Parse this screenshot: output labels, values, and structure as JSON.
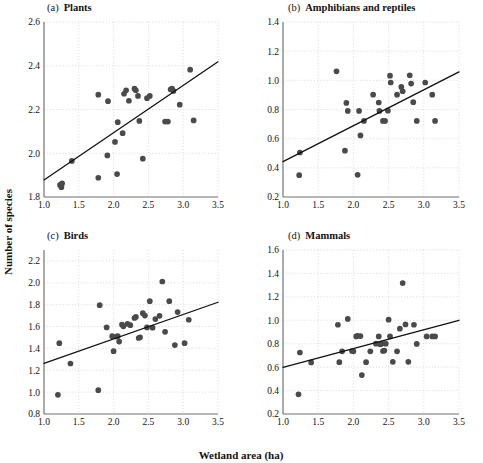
{
  "figure": {
    "xlabel": "Wetland area (ha)",
    "ylabel": "Number of species",
    "point_color": "#4a4a4a",
    "line_color": "#111111",
    "grid_color": "#c9c9c9",
    "axis_color": "#6e6e6e"
  },
  "chart_data": [
    {
      "type": "scatter",
      "panel": "a",
      "label": "(a)",
      "title": "Plants",
      "xlabel": "Wetland area (ha)",
      "ylabel": "Number of species",
      "xlim": [
        1.0,
        3.5
      ],
      "ylim": [
        1.8,
        2.6
      ],
      "xticks": [
        1.0,
        1.5,
        2.0,
        2.5,
        3.0,
        3.5
      ],
      "yticks": [
        1.8,
        2.0,
        2.2,
        2.4,
        2.6
      ],
      "xticklabels": [
        "1.0",
        "1.5",
        "2.0",
        "2.5",
        "3.0",
        "3.5"
      ],
      "yticklabels": [
        "1.8",
        "2.0",
        "2.2",
        "2.4",
        "2.6"
      ],
      "grid": true,
      "points": [
        [
          1.23,
          1.855
        ],
        [
          1.25,
          1.845
        ],
        [
          1.26,
          1.862
        ],
        [
          1.4,
          1.965
        ],
        [
          1.78,
          1.888
        ],
        [
          1.78,
          2.268
        ],
        [
          1.91,
          1.99
        ],
        [
          1.92,
          2.238
        ],
        [
          2.02,
          2.052
        ],
        [
          2.05,
          1.905
        ],
        [
          2.06,
          2.142
        ],
        [
          2.13,
          2.092
        ],
        [
          2.15,
          2.272
        ],
        [
          2.18,
          2.288
        ],
        [
          2.22,
          2.24
        ],
        [
          2.3,
          2.295
        ],
        [
          2.32,
          2.288
        ],
        [
          2.35,
          2.262
        ],
        [
          2.37,
          2.148
        ],
        [
          2.42,
          1.975
        ],
        [
          2.48,
          2.252
        ],
        [
          2.52,
          2.262
        ],
        [
          2.74,
          2.145
        ],
        [
          2.78,
          2.145
        ],
        [
          2.82,
          2.292
        ],
        [
          2.84,
          2.295
        ],
        [
          2.86,
          2.285
        ],
        [
          2.95,
          2.222
        ],
        [
          3.1,
          2.382
        ],
        [
          3.15,
          2.15
        ]
      ],
      "fit_line": {
        "x": [
          1.0,
          3.5
        ],
        "y": [
          1.878,
          2.418
        ],
        "note": "least-squares regression line"
      }
    },
    {
      "type": "scatter",
      "panel": "b",
      "label": "(b)",
      "title": "Amphibians and reptiles",
      "xlabel": "Wetland area (ha)",
      "ylabel": "Number of species",
      "xlim": [
        1.0,
        3.5
      ],
      "ylim": [
        0.2,
        1.4
      ],
      "xticks": [
        1.0,
        1.5,
        2.0,
        2.5,
        3.0,
        3.5
      ],
      "yticks": [
        0.2,
        0.4,
        0.6,
        0.8,
        1.0,
        1.2,
        1.4
      ],
      "xticklabels": [
        "1.0",
        "1.5",
        "2.0",
        "2.5",
        "3.0",
        "3.5"
      ],
      "yticklabels": [
        "0.2",
        "0.4",
        "0.6",
        "0.8",
        "1.0",
        "1.2",
        "1.4"
      ],
      "grid": true,
      "points": [
        [
          1.23,
          0.35
        ],
        [
          1.24,
          0.505
        ],
        [
          1.76,
          1.062
        ],
        [
          1.88,
          0.518
        ],
        [
          1.9,
          0.845
        ],
        [
          1.92,
          0.79
        ],
        [
          2.06,
          0.352
        ],
        [
          2.08,
          0.79
        ],
        [
          2.1,
          0.622
        ],
        [
          2.15,
          0.722
        ],
        [
          2.28,
          0.902
        ],
        [
          2.36,
          0.848
        ],
        [
          2.37,
          0.79
        ],
        [
          2.42,
          0.722
        ],
        [
          2.45,
          0.722
        ],
        [
          2.49,
          0.792
        ],
        [
          2.52,
          1.032
        ],
        [
          2.53,
          0.985
        ],
        [
          2.62,
          0.902
        ],
        [
          2.68,
          0.955
        ],
        [
          2.7,
          0.925
        ],
        [
          2.8,
          1.035
        ],
        [
          2.82,
          0.978
        ],
        [
          2.85,
          0.85
        ],
        [
          2.9,
          0.722
        ],
        [
          3.02,
          0.985
        ],
        [
          3.12,
          0.902
        ],
        [
          3.16,
          0.722
        ]
      ],
      "fit_line": {
        "x": [
          1.0,
          3.5
        ],
        "y": [
          0.443,
          1.058
        ],
        "note": "least-squares regression line"
      }
    },
    {
      "type": "scatter",
      "panel": "c",
      "label": "(c)",
      "title": "Birds",
      "xlabel": "Wetland area (ha)",
      "ylabel": "Number of species",
      "xlim": [
        1.0,
        3.5
      ],
      "ylim": [
        0.8,
        2.3
      ],
      "xticks": [
        1.0,
        1.5,
        2.0,
        2.5,
        3.0,
        3.5
      ],
      "yticks": [
        0.8,
        1.0,
        1.2,
        1.4,
        1.6,
        1.8,
        2.0,
        2.2
      ],
      "xticklabels": [
        "1.0",
        "1.5",
        "2.0",
        "2.5",
        "3.0",
        "3.5"
      ],
      "yticklabels": [
        "0.8",
        "1.0",
        "1.2",
        "1.4",
        "1.6",
        "1.8",
        "2.0",
        "2.2"
      ],
      "grid": true,
      "points": [
        [
          1.2,
          0.975
        ],
        [
          1.22,
          1.448
        ],
        [
          1.38,
          1.262
        ],
        [
          1.78,
          1.018
        ],
        [
          1.8,
          1.795
        ],
        [
          1.9,
          1.592
        ],
        [
          1.98,
          1.512
        ],
        [
          2.0,
          1.375
        ],
        [
          2.04,
          1.508
        ],
        [
          2.06,
          1.512
        ],
        [
          2.08,
          1.462
        ],
        [
          2.12,
          1.618
        ],
        [
          2.14,
          1.602
        ],
        [
          2.2,
          1.625
        ],
        [
          2.24,
          1.612
        ],
        [
          2.3,
          1.678
        ],
        [
          2.32,
          1.688
        ],
        [
          2.36,
          1.495
        ],
        [
          2.38,
          1.502
        ],
        [
          2.42,
          1.722
        ],
        [
          2.45,
          1.7
        ],
        [
          2.48,
          1.592
        ],
        [
          2.52,
          1.832
        ],
        [
          2.56,
          1.59
        ],
        [
          2.6,
          1.668
        ],
        [
          2.66,
          1.698
        ],
        [
          2.7,
          2.012
        ],
        [
          2.74,
          1.552
        ],
        [
          2.8,
          1.832
        ],
        [
          2.88,
          1.43
        ],
        [
          2.92,
          1.732
        ],
        [
          3.02,
          1.448
        ],
        [
          3.08,
          1.662
        ]
      ],
      "fit_line": {
        "x": [
          1.0,
          3.5
        ],
        "y": [
          1.262,
          1.822
        ],
        "note": "least-squares regression line"
      }
    },
    {
      "type": "scatter",
      "panel": "d",
      "label": "(d)",
      "title": "Mammals",
      "xlabel": "Wetland area (ha)",
      "ylabel": "Number of species",
      "xlim": [
        1.0,
        3.5
      ],
      "ylim": [
        0.2,
        1.6
      ],
      "xticks": [
        1.0,
        1.5,
        2.0,
        2.5,
        3.0,
        3.5
      ],
      "yticks": [
        0.2,
        0.4,
        0.6,
        0.8,
        1.0,
        1.2,
        1.4,
        1.6
      ],
      "xticklabels": [
        "1.0",
        "1.5",
        "2.0",
        "2.5",
        "3.0",
        "3.5"
      ],
      "yticklabels": [
        "0.2",
        "0.4",
        "0.6",
        "0.8",
        "1.0",
        "1.2",
        "1.4",
        "1.6"
      ],
      "grid": true,
      "points": [
        [
          1.22,
          0.368
        ],
        [
          1.24,
          0.725
        ],
        [
          1.4,
          0.64
        ],
        [
          1.78,
          0.962
        ],
        [
          1.8,
          0.642
        ],
        [
          1.84,
          0.735
        ],
        [
          1.92,
          1.012
        ],
        [
          1.98,
          0.738
        ],
        [
          2.0,
          0.735
        ],
        [
          2.04,
          0.862
        ],
        [
          2.06,
          0.868
        ],
        [
          2.1,
          0.865
        ],
        [
          2.12,
          0.532
        ],
        [
          2.18,
          0.642
        ],
        [
          2.24,
          0.735
        ],
        [
          2.32,
          0.8
        ],
        [
          2.36,
          0.862
        ],
        [
          2.38,
          0.795
        ],
        [
          2.4,
          0.8
        ],
        [
          2.42,
          0.738
        ],
        [
          2.44,
          0.742
        ],
        [
          2.46,
          0.8
        ],
        [
          2.5,
          1.005
        ],
        [
          2.52,
          0.862
        ],
        [
          2.56,
          0.645
        ],
        [
          2.62,
          0.735
        ],
        [
          2.66,
          0.928
        ],
        [
          2.7,
          1.318
        ],
        [
          2.74,
          0.965
        ],
        [
          2.78,
          0.645
        ],
        [
          2.86,
          0.962
        ],
        [
          2.9,
          0.798
        ],
        [
          3.04,
          0.862
        ],
        [
          3.12,
          0.862
        ],
        [
          3.16,
          0.862
        ]
      ],
      "fit_line": {
        "x": [
          1.0,
          3.5
        ],
        "y": [
          0.598,
          1.0
        ],
        "note": "least-squares regression line"
      }
    }
  ]
}
